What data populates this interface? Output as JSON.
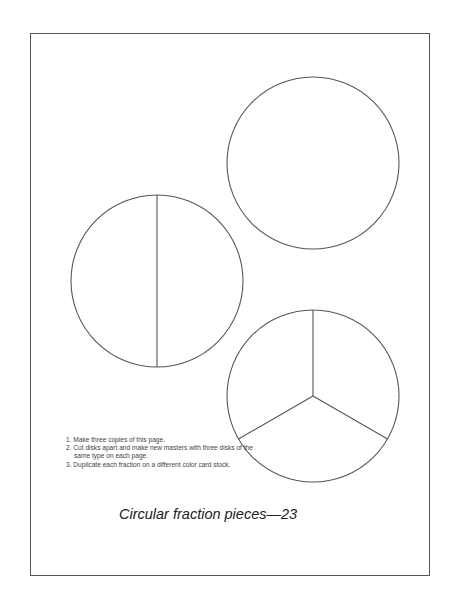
{
  "page": {
    "title": "Circular fraction pieces—23",
    "instructions": [
      "1. Make three copies of this page.",
      "2. Cut disks apart and make new masters with three disks of the same type on each page.",
      "3. Duplicate each fraction on a different color card stock."
    ],
    "disks": [
      {
        "name": "whole-disk",
        "pieces": 1,
        "cx": 313,
        "cy": 163,
        "r": 86
      },
      {
        "name": "halves-disk",
        "pieces": 2,
        "cx": 157,
        "cy": 281,
        "r": 86
      },
      {
        "name": "thirds-disk",
        "pieces": 3,
        "cx": 313,
        "cy": 396,
        "r": 86
      }
    ],
    "colors": {
      "line": "#555555",
      "text": "#222222"
    }
  }
}
